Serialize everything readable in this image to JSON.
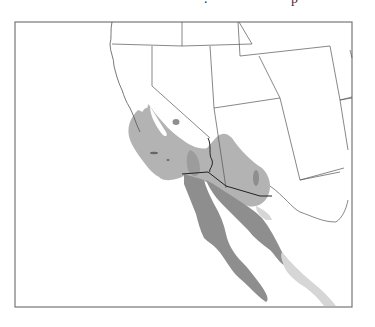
{
  "map": {
    "type": "species range map",
    "region": "Southwestern United States and northwestern Mexico",
    "frame": {
      "x": 15,
      "y": 22,
      "width": 337,
      "height": 285,
      "stroke": "#777777"
    },
    "caption_fragment": ". p",
    "range_shades": [
      {
        "name": "light-range",
        "color": "#d6d6d6",
        "area": "Sinaloa/Nayarit coastal strip"
      },
      {
        "name": "medium-range",
        "color": "#b3b3b3",
        "area": "Southern California, southern Nevada, western Arizona"
      },
      {
        "name": "dark-range",
        "color": "#8e8e8e",
        "area": "Baja California peninsula and Sonora"
      }
    ],
    "colors": {
      "background": "#ffffff",
      "land": "#ffffff",
      "state_border": "#555555",
      "intl_border": "#222222"
    }
  }
}
